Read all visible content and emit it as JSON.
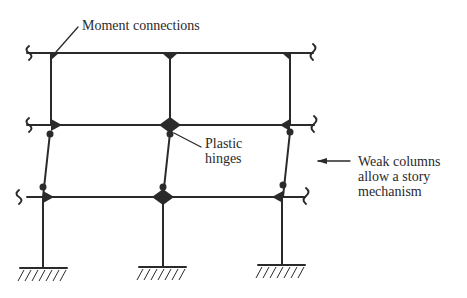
{
  "labels": {
    "moment_connections": "Moment connections",
    "plastic_line1": "Plastic",
    "plastic_line2": "hinges",
    "weak_line1": "Weak columns",
    "weak_line2": "allow a story",
    "weak_line3": "mechanism"
  },
  "colors": {
    "stroke": "#2a2a2a",
    "background": "#ffffff"
  },
  "structure": {
    "stories": 3,
    "bays": 2,
    "beams_y": [
      53,
      125,
      197
    ],
    "columns_x_top": [
      51,
      170,
      290
    ],
    "columns_x_base": [
      43,
      163,
      282
    ]
  }
}
